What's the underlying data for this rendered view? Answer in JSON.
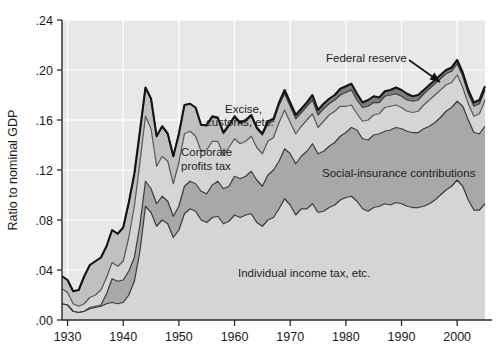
{
  "chart_data": {
    "type": "area",
    "stacked": true,
    "title": "",
    "subtitle": "",
    "xlabel": "",
    "ylabel": "Ratio to nominal GDP",
    "xlim": [
      1929,
      2005
    ],
    "ylim": [
      0.0,
      0.24
    ],
    "grid": true,
    "grid_color": "#ffffff",
    "plot_background": "#e8e8e8",
    "legend_position": "inline-annotations",
    "ytick_labels": [
      ".00",
      ".04",
      ".08",
      ".12",
      ".16",
      ".20",
      ".24"
    ],
    "ytick_values": [
      0.0,
      0.04,
      0.08,
      0.12,
      0.16,
      0.2,
      0.24
    ],
    "xtick_labels": [
      "1930",
      "1940",
      "1950",
      "1960",
      "1970",
      "1980",
      "1990",
      "2000"
    ],
    "xtick_values": [
      1930,
      1940,
      1950,
      1960,
      1970,
      1980,
      1990,
      2000
    ],
    "x": [
      1929,
      1930,
      1931,
      1932,
      1933,
      1934,
      1935,
      1936,
      1937,
      1938,
      1939,
      1940,
      1941,
      1942,
      1943,
      1944,
      1945,
      1946,
      1947,
      1948,
      1949,
      1950,
      1951,
      1952,
      1953,
      1954,
      1955,
      1956,
      1957,
      1958,
      1959,
      1960,
      1961,
      1962,
      1963,
      1964,
      1965,
      1966,
      1967,
      1968,
      1969,
      1970,
      1971,
      1972,
      1973,
      1974,
      1975,
      1976,
      1977,
      1978,
      1979,
      1980,
      1981,
      1982,
      1983,
      1984,
      1985,
      1986,
      1987,
      1988,
      1989,
      1990,
      1991,
      1992,
      1993,
      1994,
      1995,
      1996,
      1997,
      1998,
      1999,
      2000,
      2001,
      2002,
      2003,
      2004,
      2005
    ],
    "series": [
      {
        "name": "Individual income tax, etc.",
        "color": "#d5d5d5",
        "line_color": "#3c3c3c",
        "values": [
          0.013,
          0.012,
          0.007,
          0.006,
          0.007,
          0.009,
          0.01,
          0.011,
          0.013,
          0.014,
          0.013,
          0.014,
          0.02,
          0.031,
          0.055,
          0.091,
          0.086,
          0.075,
          0.08,
          0.077,
          0.066,
          0.072,
          0.085,
          0.089,
          0.087,
          0.08,
          0.078,
          0.082,
          0.083,
          0.077,
          0.079,
          0.084,
          0.082,
          0.084,
          0.085,
          0.078,
          0.075,
          0.08,
          0.082,
          0.089,
          0.097,
          0.092,
          0.084,
          0.089,
          0.089,
          0.093,
          0.086,
          0.087,
          0.09,
          0.092,
          0.096,
          0.098,
          0.099,
          0.095,
          0.089,
          0.087,
          0.09,
          0.091,
          0.093,
          0.092,
          0.094,
          0.093,
          0.091,
          0.09,
          0.09,
          0.091,
          0.093,
          0.096,
          0.1,
          0.104,
          0.107,
          0.112,
          0.107,
          0.096,
          0.088,
          0.088,
          0.093
        ]
      },
      {
        "name": "Social-insurance contributions",
        "color": "#a8a8a8",
        "line_color": "#3c3c3c",
        "values": [
          0.0,
          0.0,
          0.0,
          0.0,
          0.0,
          0.001,
          0.001,
          0.001,
          0.008,
          0.019,
          0.018,
          0.018,
          0.019,
          0.019,
          0.021,
          0.02,
          0.019,
          0.018,
          0.019,
          0.018,
          0.017,
          0.019,
          0.022,
          0.022,
          0.022,
          0.023,
          0.023,
          0.026,
          0.028,
          0.028,
          0.028,
          0.031,
          0.031,
          0.031,
          0.034,
          0.034,
          0.032,
          0.036,
          0.038,
          0.038,
          0.04,
          0.041,
          0.041,
          0.042,
          0.046,
          0.048,
          0.047,
          0.048,
          0.049,
          0.05,
          0.051,
          0.052,
          0.055,
          0.057,
          0.056,
          0.057,
          0.058,
          0.058,
          0.058,
          0.06,
          0.06,
          0.06,
          0.06,
          0.06,
          0.06,
          0.062,
          0.062,
          0.062,
          0.062,
          0.063,
          0.063,
          0.063,
          0.064,
          0.064,
          0.062,
          0.061,
          0.062
        ]
      },
      {
        "name": "Corporate profits tax",
        "color": "#d5d5d5",
        "line_color": "#5a5a5a",
        "values": [
          0.012,
          0.01,
          0.006,
          0.005,
          0.006,
          0.008,
          0.009,
          0.012,
          0.013,
          0.013,
          0.012,
          0.015,
          0.027,
          0.041,
          0.05,
          0.052,
          0.048,
          0.03,
          0.032,
          0.032,
          0.026,
          0.035,
          0.042,
          0.04,
          0.038,
          0.032,
          0.035,
          0.035,
          0.032,
          0.027,
          0.031,
          0.03,
          0.028,
          0.028,
          0.028,
          0.026,
          0.026,
          0.027,
          0.026,
          0.031,
          0.031,
          0.025,
          0.024,
          0.024,
          0.025,
          0.024,
          0.021,
          0.024,
          0.025,
          0.025,
          0.024,
          0.021,
          0.018,
          0.013,
          0.014,
          0.016,
          0.016,
          0.016,
          0.019,
          0.019,
          0.018,
          0.017,
          0.016,
          0.016,
          0.017,
          0.019,
          0.021,
          0.022,
          0.022,
          0.021,
          0.02,
          0.021,
          0.015,
          0.013,
          0.013,
          0.016,
          0.021
        ]
      },
      {
        "name": "Excise, customs, etc.",
        "color": "#c0c0c0",
        "line_color": "#3c3c3c",
        "values": [
          0.01,
          0.01,
          0.01,
          0.013,
          0.022,
          0.026,
          0.027,
          0.026,
          0.025,
          0.026,
          0.026,
          0.027,
          0.028,
          0.026,
          0.025,
          0.023,
          0.024,
          0.024,
          0.024,
          0.022,
          0.022,
          0.023,
          0.023,
          0.022,
          0.023,
          0.021,
          0.019,
          0.019,
          0.018,
          0.017,
          0.017,
          0.017,
          0.016,
          0.016,
          0.016,
          0.015,
          0.015,
          0.014,
          0.013,
          0.014,
          0.013,
          0.013,
          0.012,
          0.011,
          0.011,
          0.011,
          0.01,
          0.01,
          0.009,
          0.009,
          0.009,
          0.011,
          0.012,
          0.011,
          0.011,
          0.011,
          0.01,
          0.009,
          0.009,
          0.009,
          0.009,
          0.009,
          0.009,
          0.009,
          0.009,
          0.009,
          0.009,
          0.009,
          0.009,
          0.009,
          0.009,
          0.009,
          0.009,
          0.008,
          0.008,
          0.008,
          0.008
        ]
      },
      {
        "name": "Federal reserve",
        "color": "#7d7d7d",
        "line_color": "#141414",
        "values": [
          0.0,
          0.0,
          0.0,
          0.0,
          0.0,
          0.0,
          0.0,
          0.0,
          0.0,
          0.0,
          0.0,
          0.0,
          0.0,
          0.0,
          0.0,
          0.0,
          0.0,
          0.0,
          0.0,
          0.0,
          0.0,
          0.0,
          0.0,
          0.0,
          0.0,
          0.0,
          0.001,
          0.001,
          0.001,
          0.001,
          0.001,
          0.001,
          0.001,
          0.001,
          0.001,
          0.001,
          0.001,
          0.002,
          0.002,
          0.002,
          0.003,
          0.003,
          0.003,
          0.003,
          0.003,
          0.004,
          0.004,
          0.004,
          0.004,
          0.004,
          0.005,
          0.005,
          0.005,
          0.005,
          0.004,
          0.005,
          0.005,
          0.004,
          0.004,
          0.004,
          0.005,
          0.005,
          0.005,
          0.004,
          0.004,
          0.003,
          0.003,
          0.003,
          0.003,
          0.003,
          0.003,
          0.003,
          0.003,
          0.003,
          0.003,
          0.003,
          0.003
        ]
      }
    ],
    "annotations": [
      {
        "name": "federal-reserve",
        "text": "Federal reserve",
        "x": 326,
        "y": 62,
        "arrow": true
      },
      {
        "name": "excise-customs",
        "text": "Excise,",
        "x": 225,
        "y": 113
      },
      {
        "name": "excise-customs-2",
        "text": "customs, etc.",
        "x": 206,
        "y": 126
      },
      {
        "name": "corporate-profits",
        "text": "Corporate",
        "x": 181,
        "y": 156
      },
      {
        "name": "corporate-profits-2",
        "text": "profits tax",
        "x": 181,
        "y": 170
      },
      {
        "name": "social-insurance",
        "text": "Social-insurance contributions",
        "x": 322,
        "y": 177
      },
      {
        "name": "individual-income",
        "text": "Individual income tax, etc.",
        "x": 238,
        "y": 277
      }
    ]
  }
}
